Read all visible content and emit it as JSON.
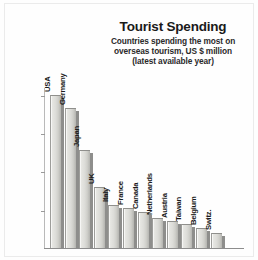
{
  "chart_data": {
    "type": "bar",
    "title": "Tourist Spending",
    "subtitle_lines": [
      "Countries spending the most on",
      "overseas tourism, US $ million",
      "(latest available year)"
    ],
    "xlabel": "",
    "ylabel": "",
    "ylim": [
      0,
      42000
    ],
    "grid": false,
    "legend": "none",
    "ytick_labels": [
      "10,000",
      "20,000",
      "30,000",
      "40,000"
    ],
    "ytick_values": [
      10000,
      20000,
      30000,
      40000
    ],
    "categories": [
      "USA",
      "Germany",
      "Japan",
      "UK",
      "Italy",
      "France",
      "Canada",
      "Netherlands",
      "Austria",
      "Taiwan",
      "Belgium",
      "Switz."
    ],
    "values": [
      40000,
      36500,
      25500,
      16000,
      11200,
      10400,
      9400,
      7800,
      7100,
      6300,
      5300,
      4000
    ]
  },
  "colors": {
    "bar_face": "#dcdcd8",
    "bar_shadow": "#8e8e8c",
    "axis": "#8d8d8d",
    "text": "#1c1c1c",
    "background": "#ffffff"
  }
}
